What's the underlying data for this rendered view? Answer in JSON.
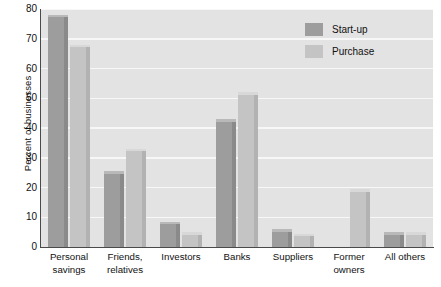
{
  "chart_data": {
    "type": "bar",
    "title": "",
    "subtitle": "",
    "xlabel": "",
    "ylabel": "Percent of businesses",
    "ylim": [
      0,
      80
    ],
    "yticks": [
      0,
      10,
      20,
      30,
      40,
      50,
      60,
      70,
      80
    ],
    "ytick_labels": [
      "0",
      "10",
      "20",
      "30",
      "40",
      "50",
      "60",
      "70",
      "80"
    ],
    "grid": true,
    "grid_axis": "y",
    "legend_position": "top-right-inside",
    "categories": [
      "Personal savings",
      "Friends, relatives",
      "Investors",
      "Banks",
      "Suppliers",
      "Former owners",
      "All others"
    ],
    "category_label_lines": [
      [
        "Personal",
        "savings"
      ],
      [
        "Friends,",
        "relatives"
      ],
      [
        "Investors"
      ],
      [
        "Banks"
      ],
      [
        "Suppliers"
      ],
      [
        "Former",
        "owners"
      ],
      [
        "All others"
      ]
    ],
    "series": [
      {
        "name": "Start-up",
        "color": "#9d9d9d",
        "values": [
          78,
          25.5,
          8.5,
          43,
          6,
          null,
          5
        ]
      },
      {
        "name": "Purchase",
        "color": "#c4c4c4",
        "values": [
          68,
          33,
          5,
          52,
          4.5,
          19.5,
          5
        ]
      }
    ]
  },
  "legend": {
    "items": [
      {
        "label": "Start-up",
        "color": "#9d9d9d"
      },
      {
        "label": "Purchase",
        "color": "#c4c4c4"
      }
    ]
  },
  "colors": {
    "plot_background": "#e3e3e3",
    "gridline": "#f7f7f7",
    "axis": "#4a4a4a",
    "text": "#111111",
    "startup": "#9d9d9d",
    "purchase": "#c4c4c4"
  }
}
